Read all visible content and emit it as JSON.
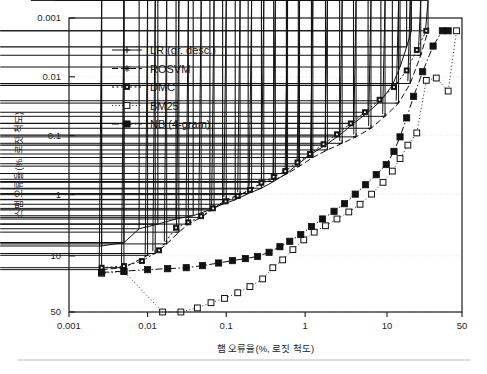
{
  "figure": {
    "background": "#ffffff",
    "axis_color": "#1a1a1a",
    "grid_color": "#d8d8d8"
  },
  "axes": {
    "x_title": "햄 오류율(%, 로짓 척도)",
    "y_title": "스팸 오류율(%, 로짓 척도)",
    "x_ticks": [
      "0.001",
      "0.01",
      "0.1",
      "1",
      "10",
      "50"
    ],
    "y_ticks": [
      "0.001",
      "0.01",
      "0.1",
      "1",
      "10",
      "50"
    ]
  },
  "legend": {
    "items": [
      {
        "label": "LR (gr. desc.)",
        "marker": "plus",
        "dash": "none",
        "color": "#111111"
      },
      {
        "label": "ROSVM",
        "marker": "star",
        "dash": "6 3",
        "color": "#111111"
      },
      {
        "label": "DMC",
        "marker": "dotsquare",
        "dash": "2 2.5",
        "color": "#111111"
      },
      {
        "label": "BM25",
        "marker": "opensquare",
        "dash": "1 2.4",
        "color": "#111111"
      },
      {
        "label": "NB (4-gram)",
        "marker": "filledsquare",
        "dash": "7 2.5 1.5 2.5",
        "color": "#111111"
      }
    ]
  },
  "chart_data": {
    "type": "line",
    "title": "",
    "subtitle": "",
    "xlabel": "햄 오류율(%, 로짓 척도)",
    "ylabel": "스팸 오류율(%, 로짓 척도)",
    "xscale": "logit",
    "yscale": "logit",
    "y_inverted": true,
    "xlim": [
      0.001,
      50
    ],
    "ylim": [
      0.001,
      50
    ],
    "x_tick_values": [
      0.001,
      0.01,
      0.1,
      1,
      10,
      50
    ],
    "y_tick_values": [
      0.001,
      0.01,
      0.1,
      1,
      10,
      50
    ],
    "grid": "horizontal-dotted",
    "legend_position": "upper-left-inside",
    "annotations": [],
    "series": [
      {
        "name": "LR (gr. desc.)",
        "marker": "plus",
        "points": [
          [
            0.0026,
            7.0
          ],
          [
            0.005,
            6.2
          ],
          [
            0.0078,
            3.7
          ],
          [
            0.0135,
            3.1
          ],
          [
            0.023,
            2.55
          ],
          [
            0.038,
            2.25
          ],
          [
            0.062,
            1.8
          ],
          [
            0.09,
            1.45
          ],
          [
            0.13,
            1.22
          ],
          [
            0.19,
            0.96
          ],
          [
            0.28,
            0.78
          ],
          [
            0.4,
            0.6
          ],
          [
            0.58,
            0.44
          ],
          [
            0.82,
            0.3
          ],
          [
            1.2,
            0.205
          ],
          [
            1.8,
            0.145
          ],
          [
            2.7,
            0.098
          ],
          [
            4.0,
            0.062
          ],
          [
            6.0,
            0.04
          ],
          [
            8.5,
            0.0255
          ],
          [
            11.5,
            0.014
          ],
          [
            14.0,
            0.0068
          ],
          [
            16.5,
            0.0031
          ],
          [
            18.5,
            0.00165
          ]
        ]
      },
      {
        "name": "ROSVM",
        "marker": "star",
        "points": [
          [
            0.0026,
            16.0
          ],
          [
            0.005,
            15.0
          ],
          [
            0.01,
            9.8
          ],
          [
            0.0125,
            9.2
          ],
          [
            0.0175,
            6.5
          ],
          [
            0.025,
            4.2
          ],
          [
            0.033,
            3.1
          ],
          [
            0.048,
            2.4
          ],
          [
            0.07,
            1.7
          ],
          [
            0.1,
            1.2
          ],
          [
            0.15,
            1.0
          ],
          [
            0.21,
            0.8
          ],
          [
            0.3,
            0.62
          ],
          [
            0.42,
            0.55
          ],
          [
            0.6,
            0.44
          ],
          [
            0.85,
            0.33
          ],
          [
            1.25,
            0.235
          ],
          [
            1.9,
            0.175
          ],
          [
            2.9,
            0.135
          ],
          [
            4.3,
            0.105
          ],
          [
            6.5,
            0.075
          ],
          [
            9.5,
            0.047
          ],
          [
            13.5,
            0.028
          ],
          [
            18.0,
            0.013
          ],
          [
            23.0,
            0.0043
          ],
          [
            27.0,
            0.00165
          ]
        ]
      },
      {
        "name": "DMC",
        "marker": "dotsquare",
        "points": [
          [
            0.0026,
            15.0
          ],
          [
            0.005,
            14.2
          ],
          [
            0.0085,
            12.0
          ],
          [
            0.014,
            8.2
          ],
          [
            0.023,
            3.55
          ],
          [
            0.033,
            2.9
          ],
          [
            0.048,
            2.3
          ],
          [
            0.068,
            1.7
          ],
          [
            0.098,
            1.3
          ],
          [
            0.14,
            1.05
          ],
          [
            0.2,
            0.83
          ],
          [
            0.28,
            0.63
          ],
          [
            0.4,
            0.5
          ],
          [
            0.56,
            0.4
          ],
          [
            0.8,
            0.285
          ],
          [
            1.15,
            0.205
          ],
          [
            1.7,
            0.14
          ],
          [
            2.5,
            0.095
          ],
          [
            3.7,
            0.062
          ],
          [
            5.5,
            0.04
          ],
          [
            8.2,
            0.0245
          ],
          [
            12.0,
            0.015
          ],
          [
            16.5,
            0.0078
          ],
          [
            21.0,
            0.0035
          ],
          [
            26.0,
            0.00165
          ]
        ]
      },
      {
        "name": "BM25",
        "marker": "opensquare",
        "points": [
          [
            0.0026,
            18.0
          ],
          [
            0.005,
            17.0
          ],
          [
            0.0155,
            50.0
          ],
          [
            0.0265,
            50.0
          ],
          [
            0.043,
            46.0
          ],
          [
            0.064,
            41.0
          ],
          [
            0.095,
            37.0
          ],
          [
            0.14,
            32.0
          ],
          [
            0.2,
            27.0
          ],
          [
            0.29,
            21.5
          ],
          [
            0.39,
            15.0
          ],
          [
            0.52,
            11.5
          ],
          [
            0.7,
            8.0
          ],
          [
            0.96,
            5.6
          ],
          [
            1.3,
            4.2
          ],
          [
            1.8,
            3.3
          ],
          [
            2.5,
            2.55
          ],
          [
            3.5,
            1.95
          ],
          [
            4.8,
            1.45
          ],
          [
            6.6,
            0.98
          ],
          [
            9.0,
            0.62
          ],
          [
            11.5,
            0.4
          ],
          [
            14.0,
            0.245
          ],
          [
            17.0,
            0.145
          ],
          [
            21.0,
            0.09
          ],
          [
            26.0,
            0.0115
          ],
          [
            32.0,
            0.0105
          ],
          [
            40.0,
            0.0175
          ],
          [
            46.0,
            0.00165
          ]
        ]
      },
      {
        "name": "NB (4-gram)",
        "marker": "filledsquare",
        "points": [
          [
            0.0026,
            17.5
          ],
          [
            0.005,
            16.8
          ],
          [
            0.01,
            16.0
          ],
          [
            0.018,
            15.5
          ],
          [
            0.031,
            15.0
          ],
          [
            0.05,
            14.0
          ],
          [
            0.08,
            12.8
          ],
          [
            0.12,
            11.8
          ],
          [
            0.175,
            11.0
          ],
          [
            0.25,
            10.2
          ],
          [
            0.35,
            8.8
          ],
          [
            0.48,
            7.2
          ],
          [
            0.64,
            5.9
          ],
          [
            0.88,
            4.6
          ],
          [
            1.2,
            3.4
          ],
          [
            1.65,
            2.55
          ],
          [
            2.3,
            1.9
          ],
          [
            3.1,
            1.42
          ],
          [
            4.2,
            0.98
          ],
          [
            5.6,
            0.68
          ],
          [
            7.5,
            0.46
          ],
          [
            9.8,
            0.31
          ],
          [
            12.0,
            0.185
          ],
          [
            14.0,
            0.105
          ],
          [
            16.5,
            0.05
          ],
          [
            19.5,
            0.0215
          ],
          [
            24.0,
            0.0082
          ],
          [
            30.0,
            0.003
          ],
          [
            36.0,
            0.00165
          ],
          [
            40.0,
            0.00165
          ]
        ]
      }
    ]
  }
}
